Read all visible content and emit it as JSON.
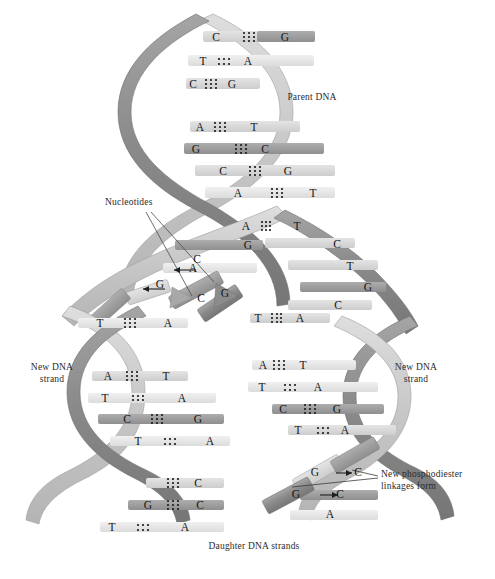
{
  "figure": {
    "background_color": "#ffffff"
  },
  "colors": {
    "dark_ribbon": "#8c8c8c",
    "light_ribbon": "#c9c9c9",
    "base_dark": "#9a9a9a",
    "base_light": "#d2d2d2",
    "base_pale": "#e6e6e6",
    "text": "#2a2a2a",
    "bond_dot": "#1f1f1f",
    "outline": "#6f6f6f"
  },
  "labels": {
    "parent_dna": "Parent DNA",
    "nucleotides": "Nucleotides",
    "new_dna_strand_left": "New DNA\nstrand",
    "new_dna_strand_right": "New DNA\nstrand",
    "new_phosphodiester": "New phosphodiester\nlinkages form",
    "daughter_dna_strands": "Daughter DNA strands"
  },
  "parent_dna": {
    "description": "Intact double helix at top of figure, two antiparallel ribbons with paired bases",
    "base_pairs": [
      {
        "left": "C",
        "right": "G",
        "bonds": 3
      },
      {
        "left": "T",
        "right": "A",
        "bonds": 2
      },
      {
        "left": "C",
        "right": "G",
        "bonds": 3
      },
      {
        "left": "A",
        "right": "T",
        "bonds": 2
      },
      {
        "left": "G",
        "right": "C",
        "bonds": 3
      },
      {
        "left": "C",
        "right": "G",
        "bonds": 3
      },
      {
        "left": "A",
        "right": "T",
        "bonds": 3
      }
    ]
  },
  "replication_fork": {
    "description": "Unwound region where the two parent strands separate; unpaired template bases exposed",
    "left_template_unpaired": [
      "G",
      "A"
    ],
    "right_template_unpaired": [
      "C",
      "T",
      "G",
      "C"
    ],
    "free_nucleotides": [
      "C",
      "G",
      "C",
      "G"
    ],
    "incoming_arrows": 2
  },
  "daughter_left": {
    "label": "New DNA strand",
    "base_pairs": [
      {
        "left": "T",
        "right": "A",
        "bonds": 3
      },
      {
        "left": "A",
        "right": "T",
        "bonds": 3
      },
      {
        "left": "T",
        "right": "A",
        "bonds": 2
      },
      {
        "left": "C",
        "right": "G",
        "bonds": 3
      },
      {
        "left": "T",
        "right": "A",
        "bonds": 2
      },
      {
        "left": "G",
        "right": "C",
        "bonds": 3
      },
      {
        "left": "G",
        "right": "C",
        "bonds": 3
      },
      {
        "left": "T",
        "right": "A",
        "bonds": 2
      }
    ]
  },
  "daughter_right": {
    "label": "New DNA strand",
    "base_pairs": [
      {
        "left": "T",
        "right": "A",
        "bonds": 3
      },
      {
        "left": "A",
        "right": "T",
        "bonds": 3
      },
      {
        "left": "T",
        "right": "A",
        "bonds": 2
      },
      {
        "left": "C",
        "right": "G",
        "bonds": 3
      },
      {
        "left": "T",
        "right": "A",
        "bonds": 2
      }
    ],
    "linkage_events": [
      {
        "from": "G",
        "to": "C",
        "arrow": "→"
      },
      {
        "from": "G",
        "to": "C",
        "arrow": "→"
      }
    ],
    "trailing_base": "A"
  }
}
